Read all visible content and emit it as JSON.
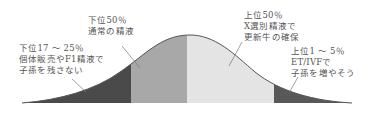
{
  "diagram": {
    "type": "bell-curve",
    "colors": {
      "outline": "#555555",
      "segment_bottom_tail": "#4a4a4a",
      "segment_lower_half": "#a8a8a8",
      "segment_upper_half": "#e4e4e4",
      "segment_top_tail": "#585858",
      "leader_line": "#666666",
      "text": "#555555"
    },
    "segments": [
      {
        "id": "bottom-tail",
        "label_lines": [
          "下位17 ～ 25％",
          "個体販売やF1精液で",
          "子孫を残さない"
        ]
      },
      {
        "id": "lower-half",
        "label_lines": [
          "下位50％",
          "通常の精液"
        ]
      },
      {
        "id": "upper-half",
        "label_lines": [
          "上位50％",
          "X選別精液で",
          "更新牛の確保"
        ]
      },
      {
        "id": "top-tail",
        "label_lines": [
          "上位1 ～ 5％",
          "ET/IVFで",
          "子孫を増やそう"
        ]
      }
    ]
  }
}
